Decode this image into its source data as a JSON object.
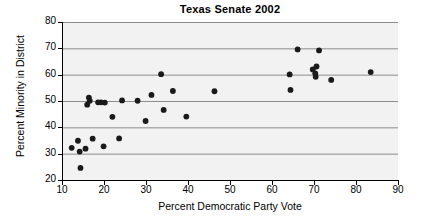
{
  "chart_data": {
    "type": "scatter",
    "title": "Texas Senate 2002",
    "xlabel": "Percent Democratic Party Vote",
    "ylabel": "Percent Minority in District",
    "xlim": [
      10,
      90
    ],
    "ylim": [
      20,
      80
    ],
    "xticks": [
      10,
      20,
      30,
      40,
      50,
      60,
      70,
      80,
      90
    ],
    "yticks": [
      20,
      30,
      40,
      50,
      60,
      70,
      80
    ],
    "grid": "horizontal",
    "legend": null,
    "marker": {
      "shape": "circle",
      "color": "#1a1a1a",
      "size": 5
    },
    "background": "#f2f2f2",
    "points": [
      {
        "x": 12.3,
        "y": 32.2
      },
      {
        "x": 13.8,
        "y": 34.9
      },
      {
        "x": 14.2,
        "y": 30.8
      },
      {
        "x": 14.4,
        "y": 24.6
      },
      {
        "x": 15.6,
        "y": 31.9
      },
      {
        "x": 16.0,
        "y": 48.6
      },
      {
        "x": 16.4,
        "y": 51.3
      },
      {
        "x": 16.6,
        "y": 50.1
      },
      {
        "x": 17.3,
        "y": 35.7
      },
      {
        "x": 18.6,
        "y": 49.5
      },
      {
        "x": 19.3,
        "y": 49.5
      },
      {
        "x": 19.9,
        "y": 32.8
      },
      {
        "x": 20.2,
        "y": 49.4
      },
      {
        "x": 22.0,
        "y": 44.0
      },
      {
        "x": 23.6,
        "y": 35.8
      },
      {
        "x": 24.3,
        "y": 50.2
      },
      {
        "x": 28.0,
        "y": 50.1
      },
      {
        "x": 29.9,
        "y": 42.4
      },
      {
        "x": 31.3,
        "y": 52.3
      },
      {
        "x": 33.6,
        "y": 60.2
      },
      {
        "x": 34.2,
        "y": 46.6
      },
      {
        "x": 36.4,
        "y": 53.8
      },
      {
        "x": 39.6,
        "y": 44.1
      },
      {
        "x": 46.3,
        "y": 53.7
      },
      {
        "x": 64.2,
        "y": 60.1
      },
      {
        "x": 64.4,
        "y": 54.2
      },
      {
        "x": 66.1,
        "y": 69.6
      },
      {
        "x": 69.7,
        "y": 62.0
      },
      {
        "x": 70.3,
        "y": 60.5
      },
      {
        "x": 70.4,
        "y": 59.2
      },
      {
        "x": 70.6,
        "y": 63.1
      },
      {
        "x": 71.2,
        "y": 69.2
      },
      {
        "x": 74.1,
        "y": 58.0
      },
      {
        "x": 83.5,
        "y": 61.0
      }
    ]
  }
}
